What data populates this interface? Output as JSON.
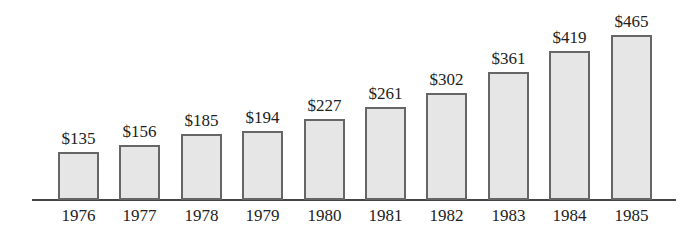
{
  "chart_data": {
    "type": "bar",
    "title": "",
    "xlabel": "",
    "ylabel": "",
    "categories": [
      "1976",
      "1977",
      "1978",
      "1979",
      "1980",
      "1981",
      "1982",
      "1983",
      "1984",
      "1985"
    ],
    "values": [
      135,
      156,
      185,
      194,
      227,
      261,
      302,
      361,
      419,
      465
    ],
    "value_labels": [
      "$135",
      "$156",
      "$185",
      "$194",
      "$227",
      "$261",
      "$302",
      "$361",
      "$419",
      "$465"
    ],
    "ylim": [
      0,
      500
    ],
    "grid": false,
    "legend": null,
    "colors": {
      "bar_fill": "#e6e6e6",
      "bar_border": "#666666",
      "axis": "#444444"
    }
  }
}
